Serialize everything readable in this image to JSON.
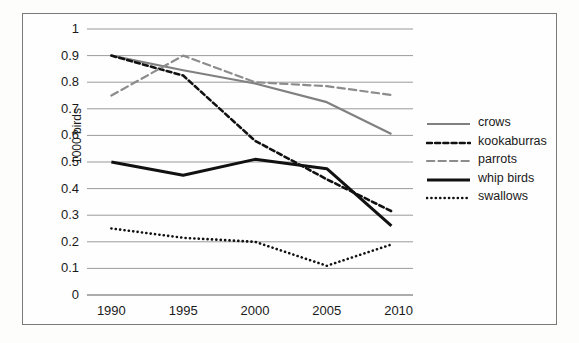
{
  "chart_data": {
    "type": "line",
    "title": "",
    "xlabel": "",
    "ylabel": "1000 birds",
    "x": [
      1990,
      1995,
      2000,
      2005,
      2010
    ],
    "xticklabels": [
      "1990",
      "1995",
      "2000",
      "2005",
      "2010"
    ],
    "yticklabels": [
      "0",
      "0.1",
      "0.2",
      "0.3",
      "0.4",
      "0.5",
      "0.6",
      "0.7",
      "0.8",
      "0.9",
      "1"
    ],
    "ylim": [
      0,
      1
    ],
    "xlim": [
      1989,
      2011
    ],
    "ytick_step": 0.1,
    "grid": "horizontal",
    "legend_position": "right",
    "series": [
      {
        "name": "crows",
        "style": "solid",
        "color": "#808080",
        "width": 2.2,
        "x": [
          1990,
          1995,
          2000,
          2005,
          2009.5
        ],
        "values": [
          0.9,
          0.845,
          0.795,
          0.725,
          0.605
        ]
      },
      {
        "name": "kookaburras",
        "style": "dashed",
        "color": "#111111",
        "width": 2.6,
        "x": [
          1990,
          1995,
          2000,
          2005,
          2009.5
        ],
        "values": [
          0.9,
          0.825,
          0.58,
          0.435,
          0.315
        ]
      },
      {
        "name": "parrots",
        "style": "long-dashed",
        "color": "#8c8c8c",
        "width": 2.2,
        "x": [
          1990,
          1995,
          2000,
          2005,
          2009.5
        ],
        "values": [
          0.75,
          0.9,
          0.8,
          0.785,
          0.752
        ]
      },
      {
        "name": "whip birds",
        "style": "solid",
        "color": "#111111",
        "width": 3.0,
        "x": [
          1990,
          1995,
          2000,
          2005,
          2009.5
        ],
        "values": [
          0.5,
          0.45,
          0.51,
          0.475,
          0.26
        ]
      },
      {
        "name": "swallows",
        "style": "dotted",
        "color": "#111111",
        "width": 2.6,
        "x": [
          1990,
          1995,
          2000,
          2005,
          2009.5
        ],
        "values": [
          0.25,
          0.215,
          0.2,
          0.11,
          0.19
        ]
      }
    ]
  }
}
